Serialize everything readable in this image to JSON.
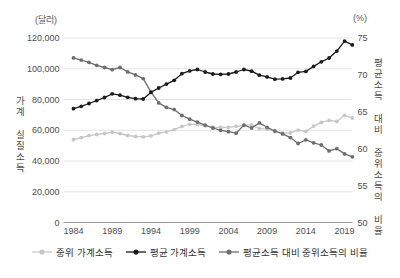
{
  "figure": {
    "left_unit_label": "(달러)",
    "right_unit_label": "(%)",
    "left_axis_title": "가계 실질소득",
    "right_axis_title": "평균소득 대비 중위소득의 비율"
  },
  "legend": [
    {
      "label": "중위 가계소득",
      "color": "#c7c7c7"
    },
    {
      "label": "평균 가계소득",
      "color": "#1a1a1a"
    },
    {
      "label": "평균소득 대비 중위소득의 비율",
      "color": "#6e6e6e"
    }
  ],
  "colors": {
    "gridline": "#e4e4e4",
    "axis_line": "#999999",
    "tick_text": "#4d4d4d",
    "background": "#ffffff"
  },
  "chart_data": {
    "type": "line",
    "title": "",
    "xlabel": "",
    "grid": true,
    "legend_position": "bottom",
    "x": [
      1984,
      1985,
      1986,
      1987,
      1988,
      1989,
      1990,
      1991,
      1992,
      1993,
      1994,
      1995,
      1996,
      1997,
      1998,
      1999,
      2000,
      2001,
      2002,
      2003,
      2004,
      2005,
      2006,
      2007,
      2008,
      2009,
      2010,
      2011,
      2012,
      2013,
      2014,
      2015,
      2016,
      2017,
      2018,
      2019,
      2020
    ],
    "x_tick_labels": [
      1984,
      1989,
      1994,
      1999,
      2004,
      2009,
      2014,
      2019
    ],
    "left_axis": {
      "unit": "(달러)",
      "title": "가계 실질소득",
      "min": 0,
      "max": 120000,
      "tick_step": 20000,
      "ticks": [
        0,
        20000,
        40000,
        60000,
        80000,
        100000,
        120000
      ]
    },
    "right_axis": {
      "unit": "(%)",
      "title": "평균소득 대비 중위소득의 비율",
      "min": 50,
      "max": 75,
      "tick_step": 5,
      "ticks": [
        50,
        55,
        60,
        65,
        70,
        75
      ]
    },
    "series": [
      {
        "name": "중위 가계소득",
        "axis": "left",
        "color": "#c7c7c7",
        "values": [
          54000,
          55200,
          56500,
          57300,
          57900,
          58700,
          57900,
          56600,
          56000,
          55700,
          56400,
          58100,
          59000,
          60400,
          62500,
          63900,
          63800,
          62800,
          62000,
          61800,
          61900,
          62600,
          63100,
          63500,
          61100,
          60700,
          59200,
          58300,
          58300,
          60100,
          59200,
          62700,
          65100,
          66400,
          65700,
          69700,
          68000
        ]
      },
      {
        "name": "평균 가계소득",
        "axis": "left",
        "color": "#1a1a1a",
        "values": [
          74000,
          75600,
          77400,
          79300,
          81300,
          83700,
          82800,
          81400,
          80500,
          80300,
          84600,
          87500,
          90000,
          92500,
          96800,
          98600,
          99500,
          97900,
          96600,
          96400,
          96600,
          97900,
          99500,
          98400,
          95800,
          94700,
          93200,
          93400,
          94000,
          97700,
          98300,
          101500,
          104500,
          107000,
          111500,
          118000,
          115500
        ]
      },
      {
        "name": "평균소득 대비 중위소득의 비율",
        "axis": "right",
        "color": "#6e6e6e",
        "values": [
          72.3,
          72.0,
          71.7,
          71.3,
          71.0,
          70.7,
          71.0,
          70.4,
          70.0,
          69.5,
          67.7,
          66.2,
          65.6,
          65.3,
          64.5,
          64.0,
          63.6,
          63.2,
          62.8,
          62.5,
          62.3,
          62.1,
          63.2,
          62.8,
          63.5,
          62.9,
          62.4,
          62.0,
          61.5,
          60.7,
          61.2,
          60.8,
          60.5,
          59.7,
          60.0,
          59.3,
          58.9
        ]
      }
    ]
  }
}
